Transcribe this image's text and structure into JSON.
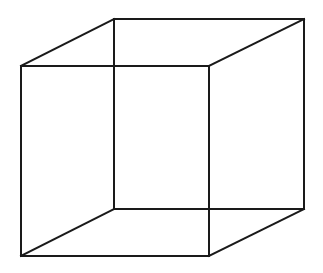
{
  "diagram": {
    "type": "necker-cube-wireframe",
    "stroke_color": "#1a1a1a",
    "stroke_width": 2,
    "background": "#ffffff",
    "vertices": {
      "front_top_left": [
        21,
        66
      ],
      "front_top_right": [
        209,
        66
      ],
      "front_bottom_left": [
        21,
        256
      ],
      "front_bottom_right": [
        209,
        256
      ],
      "back_top_left": [
        114,
        19
      ],
      "back_top_right": [
        304,
        19
      ],
      "back_bottom_left": [
        114,
        209
      ],
      "back_bottom_right": [
        304,
        209
      ]
    },
    "edges": [
      [
        "front_top_left",
        "front_top_right"
      ],
      [
        "front_top_right",
        "front_bottom_right"
      ],
      [
        "front_bottom_right",
        "front_bottom_left"
      ],
      [
        "front_bottom_left",
        "front_top_left"
      ],
      [
        "back_top_left",
        "back_top_right"
      ],
      [
        "back_top_right",
        "back_bottom_right"
      ],
      [
        "back_bottom_right",
        "back_bottom_left"
      ],
      [
        "back_bottom_left",
        "back_top_left"
      ],
      [
        "front_top_left",
        "back_top_left"
      ],
      [
        "front_top_right",
        "back_top_right"
      ],
      [
        "front_bottom_left",
        "back_bottom_left"
      ],
      [
        "front_bottom_right",
        "back_bottom_right"
      ]
    ]
  }
}
